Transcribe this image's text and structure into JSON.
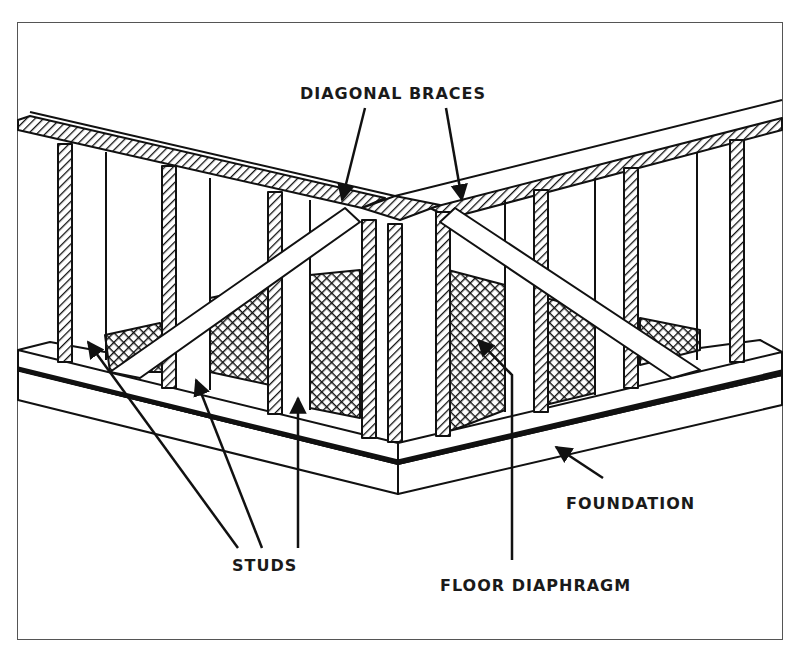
{
  "figure": {
    "colors": {
      "line": "#111111",
      "frame": "#555555",
      "background": "#ffffff"
    }
  },
  "labels": {
    "diagonal_braces": "DIAGONAL BRACES",
    "studs": "STUDS",
    "floor_diaphragm": "FLOOR DIAPHRAGM",
    "foundation": "FOUNDATION"
  },
  "components": [
    {
      "name": "top-plate",
      "pattern": "diagonal-hatch"
    },
    {
      "name": "studs",
      "pattern": "diagonal-hatch"
    },
    {
      "name": "diagonal-braces",
      "count": 2
    },
    {
      "name": "floor-diaphragm",
      "pattern": "crosshatch"
    },
    {
      "name": "foundation"
    }
  ]
}
